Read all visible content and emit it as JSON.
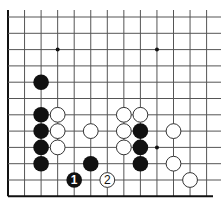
{
  "diagram": {
    "type": "go-board-problem",
    "grid": {
      "origin_x": 8,
      "origin_y": 17,
      "spacing_x": 16.55,
      "spacing_y": 16.3,
      "cols": 13,
      "rows": 12,
      "left_edge": true,
      "bottom_edge": true,
      "line_color": "#555555",
      "edge_color": "#111111"
    },
    "star_points": [
      {
        "col": 3,
        "row": 2
      },
      {
        "col": 9,
        "row": 2
      },
      {
        "col": 9,
        "row": 8
      }
    ],
    "stones": [
      {
        "color": "black",
        "col": 2,
        "row": 4,
        "label": ""
      },
      {
        "color": "black",
        "col": 2,
        "row": 6,
        "label": ""
      },
      {
        "color": "black",
        "col": 2,
        "row": 7,
        "label": ""
      },
      {
        "color": "black",
        "col": 2,
        "row": 8,
        "label": ""
      },
      {
        "color": "black",
        "col": 2,
        "row": 9,
        "label": ""
      },
      {
        "color": "white",
        "col": 3,
        "row": 6,
        "label": ""
      },
      {
        "color": "white",
        "col": 3,
        "row": 7,
        "label": ""
      },
      {
        "color": "white",
        "col": 3,
        "row": 8,
        "label": ""
      },
      {
        "color": "white",
        "col": 5,
        "row": 7,
        "label": ""
      },
      {
        "color": "black",
        "col": 5,
        "row": 9,
        "label": ""
      },
      {
        "color": "black",
        "col": 4,
        "row": 10,
        "label": "1"
      },
      {
        "color": "white",
        "col": 6,
        "row": 10,
        "label": "2"
      },
      {
        "color": "white",
        "col": 7,
        "row": 6,
        "label": ""
      },
      {
        "color": "white",
        "col": 8,
        "row": 6,
        "label": ""
      },
      {
        "color": "white",
        "col": 7,
        "row": 7,
        "label": ""
      },
      {
        "color": "white",
        "col": 7,
        "row": 8,
        "label": ""
      },
      {
        "color": "black",
        "col": 8,
        "row": 7,
        "label": ""
      },
      {
        "color": "black",
        "col": 8,
        "row": 8,
        "label": ""
      },
      {
        "color": "black",
        "col": 8,
        "row": 9,
        "label": ""
      },
      {
        "color": "white",
        "col": 10,
        "row": 7,
        "label": ""
      },
      {
        "color": "white",
        "col": 10,
        "row": 9,
        "label": ""
      },
      {
        "color": "white",
        "col": 11,
        "row": 10,
        "label": ""
      }
    ],
    "colors": {
      "black_stone": "#111111",
      "white_stone": "#ffffff",
      "white_stroke": "#333333",
      "black_label": "#ffffff",
      "white_label": "#111111"
    }
  }
}
